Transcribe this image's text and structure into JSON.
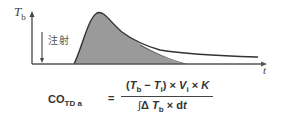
{
  "diagram": {
    "y_axis": {
      "label_main": "T",
      "label_sub": "b"
    },
    "x_axis": {
      "label": "t"
    },
    "injection": {
      "label": "注射"
    },
    "curve": {
      "fill_color": "#9a9a9a",
      "line_color": "#333333",
      "description": "thermodilution curve rising after injection, peaking, then decaying; shaded area under primary curve with recirculation tail above"
    },
    "formula": {
      "lhs_main": "CO",
      "lhs_sub": "TD a",
      "equals": "=",
      "numerator": {
        "open": "(",
        "t1": "T",
        "t1_sub": "b",
        "minus": " − ",
        "t2": "T",
        "t2_sub": "i",
        "close": ")",
        "times1": " × ",
        "v": "V",
        "v_sub": "i",
        "times2": " × ",
        "k": "K"
      },
      "denominator": {
        "integral": "∫",
        "delta": "Δ ",
        "t": "T",
        "t_sub": "b",
        "times": " × d",
        "dt": "t"
      }
    }
  }
}
